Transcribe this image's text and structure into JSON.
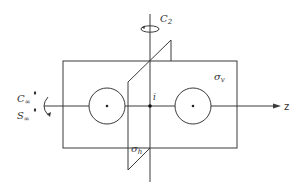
{
  "diagram": {
    "labels": {
      "c2": "C",
      "c2_sub": "2",
      "sigma_v": "σ",
      "sigma_v_sub": "v",
      "sigma_h": "σ",
      "sigma_h_sub": "h",
      "inversion": "i",
      "c_inf": "C",
      "c_inf_sub": "∞",
      "c_inf_sup": "φ",
      "s_inf": "S",
      "s_inf_sub": "∞",
      "s_inf_sup": "φ",
      "z_axis": "z"
    },
    "colors": {
      "line": "#3a3a3a",
      "background": "#ffffff"
    }
  }
}
